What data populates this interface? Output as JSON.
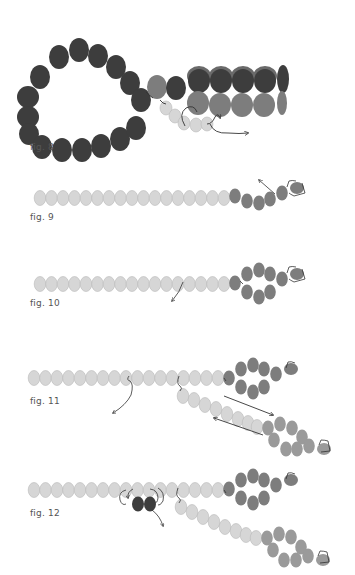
{
  "figures": [
    {
      "id": "fig8",
      "label": "fig. 8"
    },
    {
      "id": "fig9",
      "label": "fig. 9"
    },
    {
      "id": "fig10",
      "label": "fig. 10"
    },
    {
      "id": "fig11",
      "label": "fig. 11"
    },
    {
      "id": "fig12",
      "label": "fig. 12"
    }
  ],
  "colors": {
    "dark_bead": "#3d3d3d",
    "medium_bead": "#7d7d7d",
    "light_bead": "#d6d6d6",
    "light_bead_stroke": "#b8b8b8",
    "thread": "#333333"
  }
}
